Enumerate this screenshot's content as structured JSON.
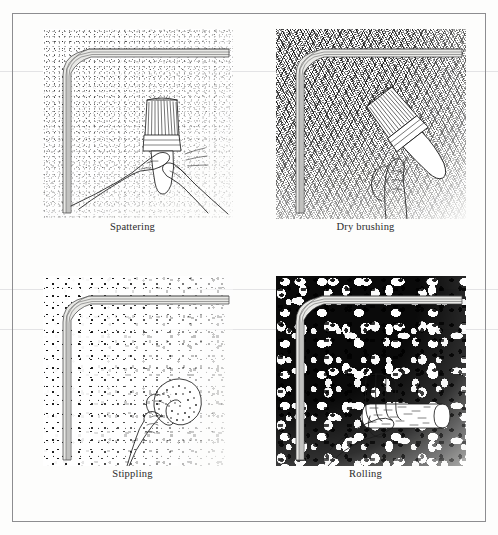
{
  "figure": {
    "frame_color": "#8d8d90",
    "ink_color": "#1c1c1c",
    "paper_color": "#fdfdfc",
    "panels": [
      {
        "id": "spattering",
        "caption": "Spattering",
        "tool": "paint-brush",
        "hands": 2,
        "texture": "fine random specks, dense at the wall corner fading outward",
        "row": 1,
        "column": 1
      },
      {
        "id": "dry-brushing",
        "caption": "Dry brushing",
        "tool": "paint-brush",
        "hands": 1,
        "texture": "diagonal crosshatched dry brush strokes",
        "row": 1,
        "column": 2
      },
      {
        "id": "stippling",
        "caption": "Stippling",
        "tool": "sponge",
        "hands": 1,
        "texture": "coarse irregular dabs on a white ground",
        "row": 2,
        "column": 1
      },
      {
        "id": "rolling",
        "caption": "Rolling",
        "tool": "paint-roller",
        "hands": 1,
        "texture": "heavy mottled dark rolled-on paint",
        "row": 2,
        "column": 2
      }
    ]
  }
}
